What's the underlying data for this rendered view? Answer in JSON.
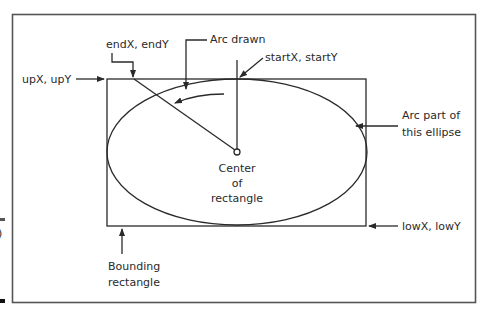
{
  "diagram": {
    "colors": {
      "line": "#2a2a2a",
      "frame": "#555555",
      "background": "#ffffff"
    },
    "labels": {
      "end_point": "endX, endY",
      "arc_drawn": "Arc drawn",
      "start_point": "startX, startY",
      "upper_corner": "upX, upY",
      "arc_part_line1": "Arc part of",
      "arc_part_line2": "this ellipse",
      "center_line1": "Center",
      "center_line2": "of",
      "center_line3": "rectangle",
      "lower_corner": "lowX, lowY",
      "bounding_line1": "Bounding",
      "bounding_line2": "rectangle",
      "margin_fragment": ")"
    },
    "shapes": {
      "outer_frame": {
        "x": 12,
        "y": 14,
        "width": 463,
        "height": 288
      },
      "bounding_rectangle": {
        "x": 107,
        "y": 79,
        "width": 259,
        "height": 147
      },
      "ellipse": {
        "cx": 237,
        "cy": 152,
        "rx": 130,
        "ry": 73
      },
      "center_point": {
        "x": 237,
        "y": 152
      },
      "start_point": {
        "x": 237,
        "y": 79
      },
      "end_point": {
        "x": 134,
        "y": 79
      }
    }
  }
}
